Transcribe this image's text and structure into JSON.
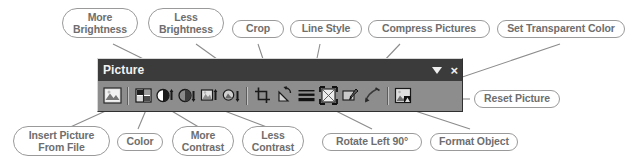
{
  "toolbar": {
    "title": "Picture",
    "title_controls": [
      {
        "name": "toolbar-options-dropdown",
        "glyph": "▼"
      },
      {
        "name": "toolbar-close-button",
        "glyph": "×"
      }
    ],
    "buttons": [
      {
        "name": "insert-picture-from-file-icon",
        "label": "Insert Picture From File"
      },
      {
        "name": "color-icon",
        "label": "Color"
      },
      {
        "name": "more-contrast-icon",
        "label": "More Contrast"
      },
      {
        "name": "less-contrast-icon",
        "label": "Less Contrast"
      },
      {
        "name": "more-brightness-icon",
        "label": "More Brightness"
      },
      {
        "name": "less-brightness-icon",
        "label": "Less Brightness"
      },
      {
        "name": "crop-icon",
        "label": "Crop"
      },
      {
        "name": "rotate-left-90-icon",
        "label": "Rotate Left 90°"
      },
      {
        "name": "line-style-icon",
        "label": "Line Style"
      },
      {
        "name": "compress-pictures-icon",
        "label": "Compress Pictures"
      },
      {
        "name": "format-object-icon",
        "label": "Format Object"
      },
      {
        "name": "set-transparent-color-icon",
        "label": "Set Transparent Color"
      },
      {
        "name": "reset-picture-icon",
        "label": "Reset Picture"
      }
    ]
  },
  "callouts": {
    "more_brightness": "More\nBrightness",
    "less_brightness": "Less\nBrightness",
    "crop": "Crop",
    "line_style": "Line Style",
    "compress_pictures": "Compress Pictures",
    "set_transparent_color": "Set Transparent Color",
    "reset_picture": "Reset Picture",
    "insert_picture_from_file": "Insert Picture\nFrom File",
    "color": "Color",
    "more_contrast": "More\nContrast",
    "less_contrast": "Less\nContrast",
    "rotate_left_90": "Rotate Left 90°",
    "format_object": "Format Object"
  },
  "colors": {
    "titlebar_bg": "#3b3b3b",
    "toolbar_bg": "#8d8d8d",
    "callout_border": "#9a9a9a",
    "callout_text": "#6e6e6e",
    "leader_line": "#8c8c8c",
    "page_bg": "#ffffff"
  }
}
